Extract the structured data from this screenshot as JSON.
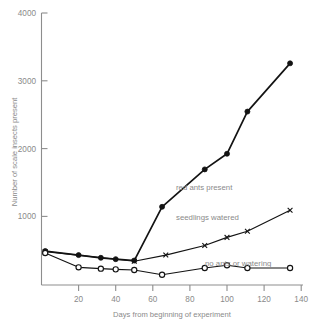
{
  "chart_data": {
    "type": "line",
    "title": "",
    "xlabel": "Days from beginning of experiment",
    "ylabel": "Number of scale insects present",
    "xlim": [
      0,
      140
    ],
    "ylim": [
      0,
      4000
    ],
    "xticks": [
      20,
      40,
      60,
      80,
      100,
      120,
      140
    ],
    "yticks": [
      1000,
      2000,
      3000,
      4000
    ],
    "xtick_labels": [
      "20",
      "40",
      "60",
      "80",
      "100",
      "120",
      "140"
    ],
    "ytick_labels": [
      "1000",
      "2000",
      "3000",
      "4000"
    ],
    "grid": false,
    "legend_position": "inline-annotations",
    "series": [
      {
        "name": "red ants present",
        "marker": "filled-circle",
        "x": [
          2,
          20,
          32,
          40,
          50,
          65,
          88,
          100,
          111,
          134
        ],
        "y": [
          500,
          440,
          400,
          380,
          360,
          1150,
          1700,
          1930,
          2550,
          3260
        ]
      },
      {
        "name": "seedlings watered",
        "marker": "x",
        "x": [
          2,
          50,
          67,
          88,
          100,
          111,
          134
        ],
        "y": [
          490,
          350,
          440,
          580,
          700,
          790,
          1100
        ]
      },
      {
        "name": "no ants or watering",
        "marker": "open-circle",
        "x": [
          2,
          20,
          32,
          40,
          50,
          65,
          88,
          100,
          111,
          134
        ],
        "y": [
          470,
          260,
          240,
          230,
          220,
          150,
          250,
          290,
          250,
          250
        ]
      }
    ]
  },
  "annotations": {
    "red_ants": "red ants present",
    "seedlings": "seedlings watered",
    "no_ants": "no ants or watering"
  },
  "colors": {
    "line": "#131313",
    "axis": "#8d8d8d",
    "text": "#8a8a8a",
    "background": "#ffffff"
  }
}
